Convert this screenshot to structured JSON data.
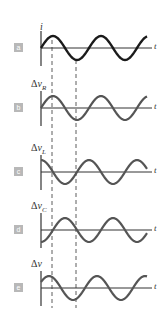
{
  "figure": {
    "time_axis_label": "t",
    "panels": [
      {
        "id": "a",
        "badge": "a",
        "quantity": "i",
        "delta": "",
        "var": "i",
        "sub": "",
        "phase_deg": 0,
        "axis_y": 48
      },
      {
        "id": "b",
        "badge": "b",
        "quantity": "Δv_R",
        "delta": "Δ",
        "var": "v",
        "sub": "R",
        "phase_deg": 0,
        "axis_y": 108
      },
      {
        "id": "c",
        "badge": "c",
        "quantity": "Δv_L",
        "delta": "Δ",
        "var": "v",
        "sub": "L",
        "phase_deg": 90,
        "axis_y": 172
      },
      {
        "id": "d",
        "badge": "d",
        "quantity": "Δv_C",
        "delta": "Δ",
        "var": "v",
        "sub": "C",
        "phase_deg": -90,
        "axis_y": 230
      },
      {
        "id": "e",
        "badge": "e",
        "quantity": "Δv",
        "delta": "Δ",
        "var": "v",
        "sub": "",
        "phase_deg": 30,
        "axis_y": 288
      }
    ],
    "reference_lines": [
      "current peak",
      "current trough"
    ],
    "colors": {
      "curve_a": "#1a1a1a",
      "curve_other": "#555555",
      "axis": "#333333",
      "badge": "#b8b8b8",
      "dashed": "#333333"
    }
  }
}
